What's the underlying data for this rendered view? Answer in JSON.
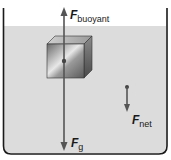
{
  "diagram": {
    "type": "free-body diagram",
    "labels": {
      "buoyant": {
        "symbol": "F",
        "subscript": "buoyant"
      },
      "gravity": {
        "symbol": "F",
        "subscript": "g"
      },
      "net": {
        "symbol": "F",
        "subscript": "net"
      }
    },
    "colors": {
      "water": "#dcdcdc",
      "container": "#1a1a1a",
      "arrow": "#555555",
      "cube_face": "#b0b0b0"
    }
  }
}
